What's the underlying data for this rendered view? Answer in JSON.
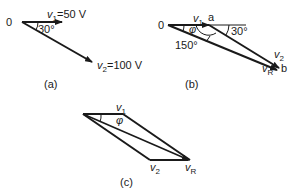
{
  "diagram": {
    "type": "phasor-diagrams",
    "panels": [
      {
        "id": "a",
        "caption": "(a)",
        "origin_label": "0",
        "angle_label": "30°",
        "v1": {
          "symbol": "v",
          "sub": "1",
          "value": "=50 V"
        },
        "v2": {
          "symbol": "v",
          "sub": "2",
          "value": "=100 V"
        }
      },
      {
        "id": "b",
        "caption": "(b)",
        "origin_label": "0",
        "point_a": "a",
        "point_b": "b",
        "angle_30": "30°",
        "angle_150": "150°",
        "phi": "φ",
        "v1": {
          "symbol": "v",
          "sub": "1"
        },
        "v2": {
          "symbol": "v",
          "sub": "2"
        },
        "vR": {
          "symbol": "v",
          "sub": "R"
        }
      },
      {
        "id": "c",
        "caption": "(c)",
        "phi": "φ",
        "v1": {
          "symbol": "v",
          "sub": "1"
        },
        "v2": {
          "symbol": "v",
          "sub": "2"
        },
        "vR": {
          "symbol": "v",
          "sub": "R"
        }
      }
    ]
  },
  "colors": {
    "stroke": "#1a1a1a",
    "background": "#ffffff"
  }
}
